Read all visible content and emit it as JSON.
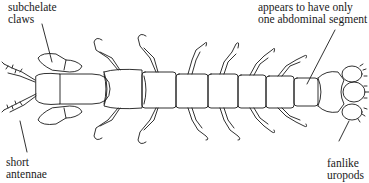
{
  "diagram": {
    "labels": {
      "claws": {
        "line1": "subchelate",
        "line2": "claws"
      },
      "segment": {
        "line1": "appears to have only",
        "line2": "one abdominal segment"
      },
      "antennae": {
        "line1": "short",
        "line2": "antennae"
      },
      "uropods": {
        "line1": "fanlike",
        "line2": "uropods"
      }
    },
    "colors": {
      "ink": "#1a1a1a",
      "background": "#ffffff"
    }
  }
}
